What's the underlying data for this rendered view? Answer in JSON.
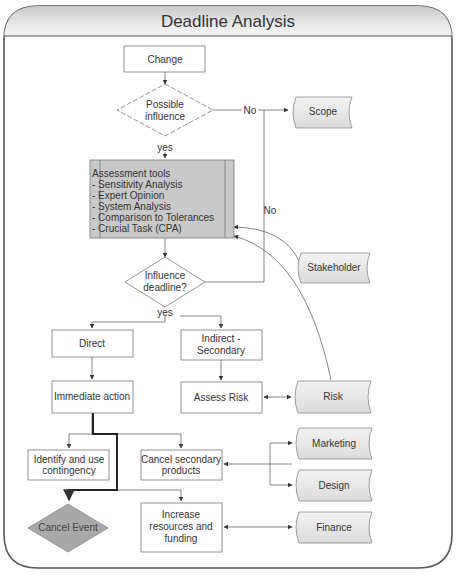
{
  "title": "Deadline Analysis",
  "nodes": {
    "change": "Change",
    "possible_influence": [
      "Possible",
      "influence"
    ],
    "scope": "Scope",
    "assessment": [
      "Assessment tools",
      "- Sensitivity Analysis",
      "- Expert Opinion",
      "- System Analysis",
      "- Comparison to Tolerances",
      "- Crucial Task (CPA)"
    ],
    "influence_deadline": [
      "Influence",
      "deadline?"
    ],
    "stakeholder": "Stakeholder",
    "direct": "Direct",
    "indirect": [
      "Indirect -",
      "Secondary"
    ],
    "immediate_action": "Immediate action",
    "assess_risk": "Assess Risk",
    "risk": "Risk",
    "identify": [
      "Identify and use",
      "contingency"
    ],
    "cancel_secondary": [
      "Cancel secondary",
      "products"
    ],
    "marketing": "Marketing",
    "design": "Design",
    "cancel_event": "Cancel Event",
    "increase": [
      "Increase",
      "resources and",
      "funding"
    ],
    "finance": "Finance"
  },
  "labels": {
    "no1": "No",
    "no2": "No",
    "yes1": "yes",
    "yes2": "yes"
  },
  "colors": {
    "frame": "#555555",
    "box_fill": "#ffffff",
    "data_fill": "#e4e4e4",
    "assessment_fill": "#c8c8c8",
    "cancel_event_fill": "#a8a8a8"
  }
}
